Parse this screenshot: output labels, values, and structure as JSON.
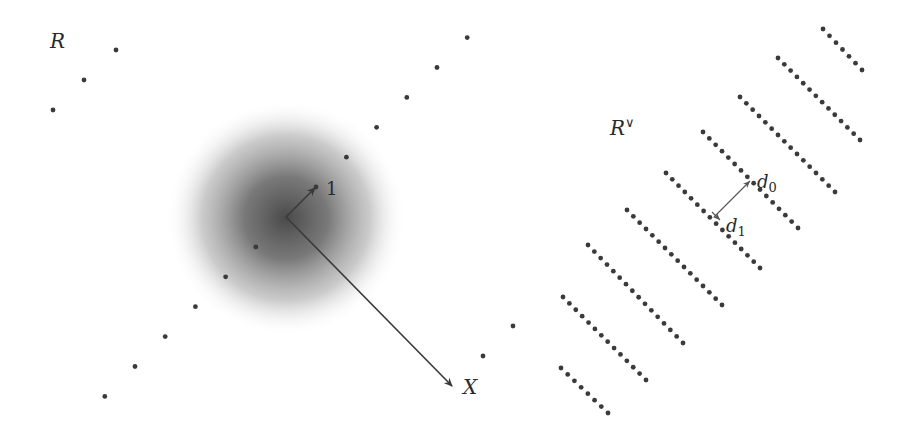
{
  "left_panel": {
    "label": "R",
    "vector_one_label": "1",
    "vector_x_label": "X",
    "description": "Lattice R with a Gaussian-shaded blob centered at the origin; short vector to lattice point labelled 1 and long vector to X"
  },
  "right_panel": {
    "label": "R",
    "label_superscript": "∨",
    "vector_d0_label": "d",
    "vector_d0_subscript": "0",
    "vector_d1_label": "d",
    "vector_d1_subscript": "1",
    "description": "Dual lattice R-dual drawn as parallel dense lines of dots, with a double-headed vector between adjacent lines labelled d0 and d1"
  },
  "colors": {
    "dot": "#3a3a3a",
    "text": "#2a2a2a",
    "blob_center": "#4a4a4a",
    "background": "#ffffff"
  }
}
